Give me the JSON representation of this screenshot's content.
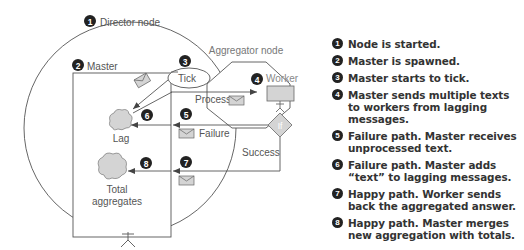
{
  "diagram": {
    "director_node": {
      "number": "1",
      "label": "Director node"
    },
    "master": {
      "number": "2",
      "label": "Master"
    },
    "tick": {
      "number": "3",
      "label": "Tick"
    },
    "aggregator_node": {
      "label": "Aggregator node"
    },
    "worker": {
      "number": "4",
      "label": "Worker"
    },
    "process_label": "Process",
    "failure": {
      "number": "5",
      "label": "Failure"
    },
    "lag": {
      "number": "6",
      "label": "Lag"
    },
    "if_label": "If",
    "success": {
      "number": "7",
      "label": "Success"
    },
    "total": {
      "number": "8",
      "label_line1": "Total",
      "label_line2": "aggregates"
    }
  },
  "legend": {
    "items": [
      {
        "number": "1",
        "text": "Node is started."
      },
      {
        "number": "2",
        "text": "Master is spawned."
      },
      {
        "number": "3",
        "text": "Master starts to tick."
      },
      {
        "number": "4",
        "text": "Master sends multiple texts to workers from lagging messages."
      },
      {
        "number": "5",
        "text": "Failure path. Master receives unprocessed text."
      },
      {
        "number": "6",
        "text": "Failure path. Master adds “text” to lagging messages."
      },
      {
        "number": "7",
        "text": "Happy path. Worker sends back the aggregated answer."
      },
      {
        "number": "8",
        "text": "Happy path. Master merges new aggregation with totals."
      }
    ]
  },
  "colors": {
    "line": "#555555",
    "fill_gray": "#d4d4d4",
    "badge": "#222222"
  }
}
